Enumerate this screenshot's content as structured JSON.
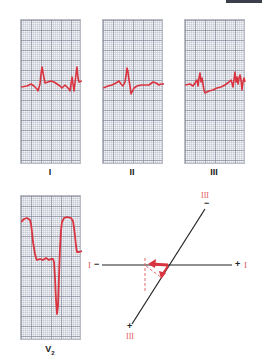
{
  "colors": {
    "trace": "#d9343f",
    "axis_line": "#222222",
    "axis_label": "#e05a5a",
    "grid_bg": "#f4f5f7"
  },
  "leads": [
    {
      "id": "I",
      "label": "I"
    },
    {
      "id": "II",
      "label": "II"
    },
    {
      "id": "III",
      "label": "III"
    },
    {
      "id": "V2",
      "label": "V",
      "subscript": "2"
    }
  ],
  "axis_diagram": {
    "lead_I": {
      "neg_label": "I",
      "neg_sign": "−",
      "pos_sign": "+",
      "pos_label": "I"
    },
    "lead_III": {
      "top_label": "III",
      "top_sign": "−",
      "bottom_sign": "+",
      "bottom_label": "III"
    }
  }
}
